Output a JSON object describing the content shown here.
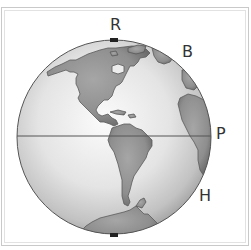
{
  "figure": {
    "type": "globe-diagram",
    "labels": [
      {
        "id": "R",
        "text": "R",
        "x": 110,
        "y": 17
      },
      {
        "id": "B",
        "text": "B",
        "x": 182,
        "y": 44
      },
      {
        "id": "P",
        "text": "P",
        "x": 216,
        "y": 126
      },
      {
        "id": "H",
        "text": "H",
        "x": 199,
        "y": 188
      }
    ],
    "globe": {
      "cx": 114,
      "cy": 137,
      "r": 97
    },
    "equator_y": 136,
    "colors": {
      "ocean_light": "#f4f4f4",
      "ocean_dark": "#9a9a9a",
      "land": "#8f8f8f",
      "outline": "#555555",
      "label": "#333333"
    }
  }
}
